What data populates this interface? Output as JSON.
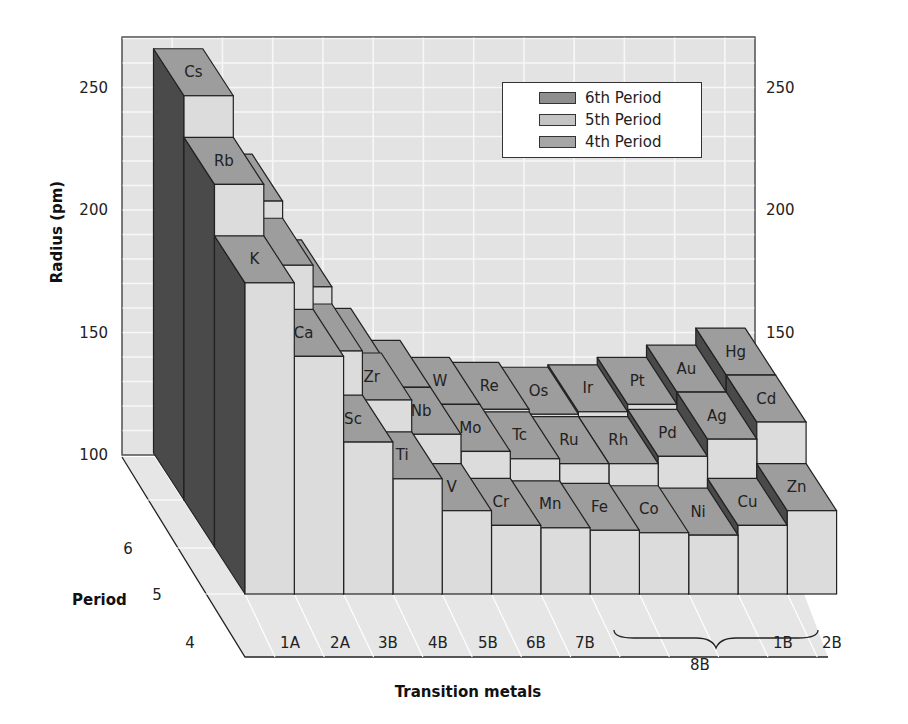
{
  "chart_data": {
    "type": "bar",
    "subtype": "3d-bar",
    "title": "",
    "ylabel": "Radius (pm)",
    "xlabel": "Transition metals",
    "zlabel": "Period",
    "ylim": [
      100,
      270
    ],
    "yticks": [
      100,
      150,
      200,
      250
    ],
    "zticks": [
      "4",
      "5",
      "6"
    ],
    "categories": [
      "1A",
      "2A",
      "3B",
      "4B",
      "5B",
      "6B",
      "7B",
      "8B",
      "8B",
      "8B",
      "1B",
      "2B"
    ],
    "group_bracket": {
      "label": "8B",
      "from_index": 7,
      "to_index": 9
    },
    "legend": [
      "6th Period",
      "5th Period",
      "4th Period"
    ],
    "legend_position": "upper right",
    "grid": true,
    "series": [
      {
        "name": "4th Period",
        "elements": [
          "K",
          "Ca",
          "Sc",
          "Ti",
          "V",
          "Cr",
          "Mn",
          "Fe",
          "Co",
          "Ni",
          "Cu",
          "Zn"
        ],
        "values": [
          227,
          197,
          162,
          147,
          134,
          128,
          127,
          126,
          125,
          124,
          128,
          134
        ]
      },
      {
        "name": "5th Period",
        "elements": [
          "Rb",
          "Sr",
          "Y",
          "Zr",
          "Nb",
          "Mo",
          "Tc",
          "Ru",
          "Rh",
          "Pd",
          "Ag",
          "Cd"
        ],
        "values": [
          248,
          215,
          180,
          160,
          146,
          139,
          136,
          134,
          134,
          137,
          144,
          151
        ]
      },
      {
        "name": "6th Period",
        "elements": [
          "Cs",
          "Ba",
          "La",
          "Hf",
          "Ta",
          "W",
          "Re",
          "Os",
          "Ir",
          "Pt",
          "Au",
          "Hg"
        ],
        "values": [
          265,
          222,
          187,
          159,
          146,
          139,
          137,
          135,
          136,
          139,
          144,
          151
        ]
      }
    ],
    "labeled_elements": [
      "Cs",
      "Rb",
      "K",
      "Ca",
      "Sc",
      "Ti",
      "V",
      "Cr",
      "Mn",
      "Fe",
      "Co",
      "Ni",
      "Cu",
      "Zn",
      "Zr",
      "Nb",
      "Mo",
      "Tc",
      "Ru",
      "Rh",
      "Pd",
      "Ag",
      "Cd",
      "W",
      "Re",
      "Os",
      "Ir",
      "Pt",
      "Au",
      "Hg"
    ]
  },
  "colors": {
    "top_face": "#9d9d9d",
    "front_face": "#dcdcdc",
    "side_face": "#4a4a4a",
    "wall": "#e3e3e3",
    "floor": "#e6e6e6",
    "gridline": "#f7f7f7",
    "legend_6th": "#8e8e8e",
    "legend_5th": "#c4c4c4",
    "legend_4th": "#a6a6a6"
  },
  "legend": {
    "items": [
      {
        "label": "6th Period"
      },
      {
        "label": "5th Period"
      },
      {
        "label": "4th Period"
      }
    ]
  },
  "axes": {
    "y_title": "Radius (pm)",
    "x_title": "Transition metals",
    "z_title": "Period"
  }
}
